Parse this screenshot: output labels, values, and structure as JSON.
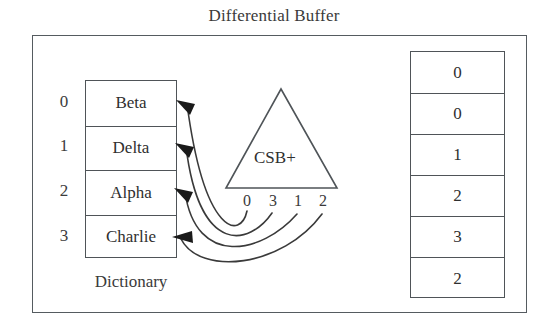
{
  "title": "Differential Buffer",
  "dictionary": {
    "caption": "Dictionary",
    "indices": [
      "0",
      "1",
      "2",
      "3"
    ],
    "entries": [
      "Beta",
      "Delta",
      "Alpha",
      "Charlie"
    ]
  },
  "index_structure": {
    "label": "CSB+",
    "leaf_keys": [
      "0",
      "3",
      "1",
      "2"
    ]
  },
  "buffer": {
    "values": [
      "0",
      "0",
      "1",
      "2",
      "3",
      "2"
    ]
  },
  "pointers": [
    {
      "from_key": "0",
      "to_entry": "Beta"
    },
    {
      "from_key": "3",
      "to_entry": "Delta"
    },
    {
      "from_key": "1",
      "to_entry": "Alpha"
    },
    {
      "from_key": "2",
      "to_entry": "Charlie"
    }
  ],
  "colors": {
    "stroke": "#4f5458",
    "frame": "#555b60",
    "text": "#2f2f2f",
    "background": "#ffffff",
    "arrow": "#1a1a1a"
  }
}
